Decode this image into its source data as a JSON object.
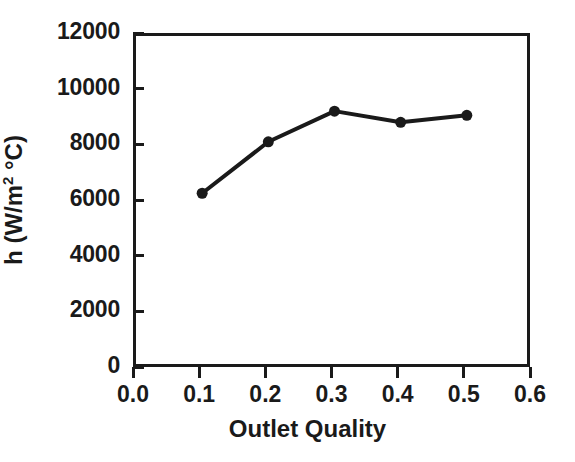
{
  "chart_data": {
    "type": "line",
    "title": "",
    "subtitle": "",
    "xlabel": "Outlet Quality",
    "ylabel": "h (W/m² °C)",
    "ylabel_parts": {
      "prefix": "h (W/m",
      "sup": "2",
      "suffix": " °C)"
    },
    "x": [
      0.1,
      0.2,
      0.3,
      0.4,
      0.5
    ],
    "values": [
      6350,
      8200,
      9300,
      8900,
      9150
    ],
    "series": [
      {
        "name": "h",
        "x": [
          0.1,
          0.2,
          0.3,
          0.4,
          0.5
        ],
        "values": [
          6350,
          8200,
          9300,
          8900,
          9150
        ]
      }
    ],
    "xlim": [
      0.0,
      0.6
    ],
    "ylim": [
      0,
      12000
    ],
    "xticks": [
      0.0,
      0.1,
      0.2,
      0.3,
      0.4,
      0.5,
      0.6
    ],
    "yticks": [
      0,
      2000,
      4000,
      6000,
      8000,
      10000,
      12000
    ],
    "xtick_labels": [
      "0.0",
      "0.1",
      "0.2",
      "0.3",
      "0.4",
      "0.5",
      "0.6"
    ],
    "ytick_labels": [
      "0",
      "2000",
      "4000",
      "6000",
      "8000",
      "10000",
      "12000"
    ],
    "grid": false,
    "legend": false,
    "legend_position": "none",
    "annotations": [],
    "colors": {
      "background": "#ffffff",
      "axis": "#1a1a1a",
      "line": "#1a1a1a",
      "marker": "#1a1a1a",
      "text": "#1a1a1a"
    },
    "style": {
      "marker": "filled-circle",
      "marker_size": 11,
      "line_width": 4,
      "frame": "full-box",
      "xtick_direction": "out",
      "ytick_direction": "in"
    }
  }
}
